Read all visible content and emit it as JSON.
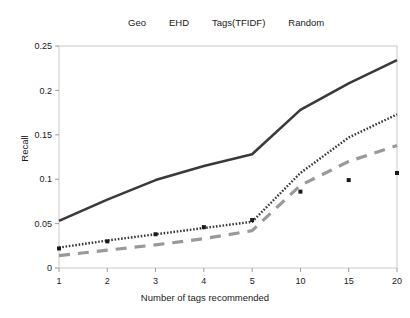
{
  "figure": {
    "clipped_header_text": "",
    "background_color": "#ffffff"
  },
  "legend": {
    "position": "top-center",
    "entries": [
      {
        "label": "Geo",
        "style": "solid",
        "color": "#3a3a3a",
        "icon": "line-solid-icon"
      },
      {
        "label": "EHD",
        "style": "dotted",
        "color": "#3a3a3a",
        "icon": "line-dotted-icon"
      },
      {
        "label": "Tags(TFIDF)",
        "style": "marker",
        "color": "#1a1a1a",
        "icon": "square-marker-icon"
      },
      {
        "label": "Random",
        "style": "dashed",
        "color": "#999999",
        "icon": "line-dashed-icon"
      }
    ]
  },
  "axes": {
    "y_label": "Recall",
    "x_label": "Number of tags recommended",
    "y_ticks": [
      "0",
      "0.05",
      "0.1",
      "0.15",
      "0.2",
      "0.25"
    ],
    "x_ticks": [
      "1",
      "2",
      "3",
      "4",
      "5",
      "10",
      "15",
      "20"
    ]
  },
  "chart_data": {
    "type": "line",
    "title": "",
    "xlabel": "Number of tags recommended",
    "ylabel": "Recall",
    "categories": [
      "1",
      "2",
      "3",
      "4",
      "5",
      "10",
      "15",
      "20"
    ],
    "ylim": [
      0,
      0.25
    ],
    "yticks": [
      0,
      0.05,
      0.1,
      0.15,
      0.2,
      0.25
    ],
    "grid": false,
    "legend_position": "top-center",
    "series": [
      {
        "name": "Geo",
        "style": "solid",
        "color": "#3a3a3a",
        "values": [
          0.053,
          0.077,
          0.099,
          0.115,
          0.128,
          0.178,
          0.208,
          0.234
        ]
      },
      {
        "name": "EHD",
        "style": "dotted",
        "color": "#3a3a3a",
        "values": [
          0.023,
          0.031,
          0.038,
          0.045,
          0.052,
          0.107,
          0.147,
          0.173
        ]
      },
      {
        "name": "Tags(TFIDF)",
        "style": "marker",
        "color": "#1a1a1a",
        "values": [
          0.022,
          0.03,
          0.038,
          0.046,
          0.054,
          0.086,
          0.099,
          0.107
        ]
      },
      {
        "name": "Random",
        "style": "dashed",
        "color": "#999999",
        "values": [
          0.014,
          0.02,
          0.026,
          0.033,
          0.042,
          0.093,
          0.12,
          0.138
        ]
      }
    ]
  }
}
